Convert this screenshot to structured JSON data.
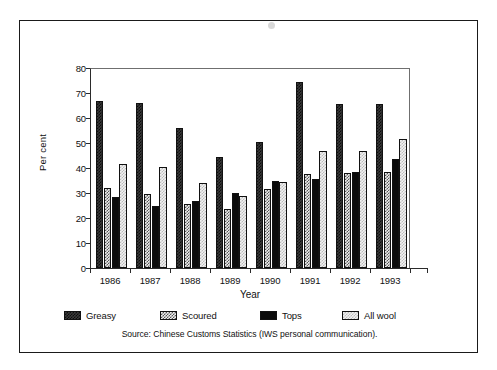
{
  "figure": {
    "source_note": "Source: Chinese Customs Statistics (IWS personal communication)."
  },
  "legend": {
    "items": [
      {
        "label": "Greasy",
        "pattern": "dark-checker",
        "color": "#3a3a3a"
      },
      {
        "label": "Scoured",
        "pattern": "gray-checker",
        "color": "#8a8a8a"
      },
      {
        "label": "Tops",
        "pattern": "solid-black",
        "color": "#0b0b0b"
      },
      {
        "label": "All wool",
        "pattern": "light-checker",
        "color": "#e0e0e0"
      }
    ]
  },
  "chart_data": {
    "type": "bar",
    "title": "",
    "xlabel": "Year",
    "ylabel": "Per cent",
    "ylim": [
      0,
      80
    ],
    "yticks": [
      0,
      10,
      20,
      30,
      40,
      50,
      60,
      70,
      80
    ],
    "grid": false,
    "legend_position": "bottom",
    "categories": [
      "1986",
      "1987",
      "1988",
      "1989",
      "1990",
      "1991",
      "1992",
      "1993"
    ],
    "series": [
      {
        "name": "Greasy",
        "values": [
          67.0,
          66.0,
          56.0,
          44.5,
          50.5,
          74.5,
          65.5,
          65.5
        ]
      },
      {
        "name": "Scoured",
        "values": [
          32.0,
          29.5,
          25.5,
          23.5,
          31.5,
          37.5,
          38.0,
          38.5
        ]
      },
      {
        "name": "Tops",
        "values": [
          28.5,
          25.0,
          27.0,
          30.0,
          35.0,
          35.5,
          38.5,
          43.5
        ]
      },
      {
        "name": "All wool",
        "values": [
          41.5,
          40.5,
          34.0,
          29.0,
          34.5,
          47.0,
          47.0,
          51.5
        ]
      }
    ]
  }
}
